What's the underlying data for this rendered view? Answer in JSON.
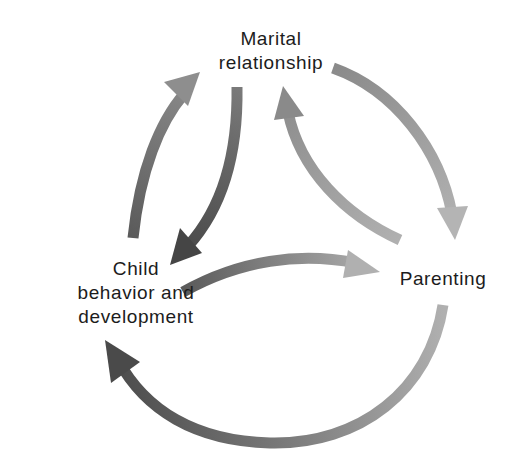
{
  "diagram": {
    "type": "cycle-diagram",
    "nodes": {
      "marital": {
        "lines": [
          "Marital",
          "relationship"
        ]
      },
      "child": {
        "lines": [
          "Child",
          "behavior and",
          "development"
        ]
      },
      "parenting": {
        "lines": [
          "Parenting"
        ]
      }
    },
    "edges": [
      {
        "from": "Child behavior and development",
        "to": "Marital relationship",
        "position": "outer-left"
      },
      {
        "from": "Marital relationship",
        "to": "Parenting",
        "position": "outer-right"
      },
      {
        "from": "Parenting",
        "to": "Child behavior and development",
        "position": "outer-bottom"
      },
      {
        "from": "Marital relationship",
        "to": "Child behavior and development",
        "position": "inner-left"
      },
      {
        "from": "Child behavior and development",
        "to": "Parenting",
        "position": "inner-bottom"
      },
      {
        "from": "Parenting",
        "to": "Marital relationship",
        "position": "inner-right"
      }
    ],
    "colors": {
      "dark_arrow": "#505050",
      "mid_arrow": "#7a7a7a",
      "light_arrow": "#a8a8a8",
      "text": "#1c1c1c",
      "background": "#ffffff"
    }
  }
}
